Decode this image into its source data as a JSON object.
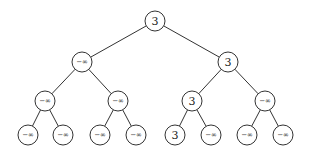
{
  "diagram": {
    "type": "binary-tree",
    "nodes": [
      {
        "id": "n0",
        "label": "3",
        "x": 155,
        "y": 21,
        "parent": null
      },
      {
        "id": "n1",
        "label": "−∞",
        "x": 82,
        "y": 62,
        "parent": "n0"
      },
      {
        "id": "n2",
        "label": "3",
        "x": 228,
        "y": 62,
        "parent": "n0"
      },
      {
        "id": "n3",
        "label": "−∞",
        "x": 45,
        "y": 101,
        "parent": "n1"
      },
      {
        "id": "n4",
        "label": "−∞",
        "x": 118,
        "y": 101,
        "parent": "n1"
      },
      {
        "id": "n5",
        "label": "3",
        "x": 192,
        "y": 101,
        "parent": "n2"
      },
      {
        "id": "n6",
        "label": "−∞",
        "x": 265,
        "y": 101,
        "parent": "n2"
      },
      {
        "id": "n7",
        "label": "−∞",
        "x": 28,
        "y": 135,
        "parent": "n3"
      },
      {
        "id": "n8",
        "label": "−∞",
        "x": 63,
        "y": 135,
        "parent": "n3"
      },
      {
        "id": "n9",
        "label": "−∞",
        "x": 100,
        "y": 135,
        "parent": "n4"
      },
      {
        "id": "n10",
        "label": "−∞",
        "x": 136,
        "y": 135,
        "parent": "n4"
      },
      {
        "id": "n11",
        "label": "3",
        "x": 175,
        "y": 135,
        "parent": "n5"
      },
      {
        "id": "n12",
        "label": "−∞",
        "x": 211,
        "y": 135,
        "parent": "n5"
      },
      {
        "id": "n13",
        "label": "−∞",
        "x": 247,
        "y": 135,
        "parent": "n6"
      },
      {
        "id": "n14",
        "label": "−∞",
        "x": 283,
        "y": 135,
        "parent": "n6"
      }
    ],
    "node_radius": 10,
    "stroke_color": "#333333"
  }
}
